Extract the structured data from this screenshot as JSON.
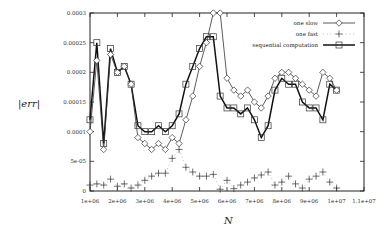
{
  "chart_data": {
    "type": "line",
    "title": "",
    "xlabel": "N",
    "ylabel": "|err|",
    "xlim": [
      1000000,
      11000000
    ],
    "ylim": [
      0,
      0.0003
    ],
    "grid": false,
    "legend_position": "top-right inside",
    "x_ticks": [
      "1e+06",
      "2e+06",
      "3e+06",
      "4e+06",
      "5e+06",
      "6e+06",
      "7e+06",
      "8e+06",
      "9e+06",
      "1e+07",
      "1.1e+07"
    ],
    "y_ticks": [
      "0",
      "5e-05",
      "0.0001",
      "0.00015",
      "0.0002",
      "0.00025",
      "0.0003"
    ],
    "x": [
      1000000,
      1250000,
      1500000,
      1750000,
      2000000,
      2250000,
      2500000,
      2750000,
      3000000,
      3250000,
      3500000,
      3750000,
      4000000,
      4250000,
      4500000,
      4750000,
      5000000,
      5250000,
      5500000,
      5750000,
      6000000,
      6250000,
      6500000,
      6750000,
      7000000,
      7250000,
      7500000,
      7750000,
      8000000,
      8250000,
      8500000,
      8750000,
      9000000,
      9250000,
      9500000,
      9750000,
      10000000
    ],
    "series": [
      {
        "name": "one slow",
        "marker": "diamond",
        "line": "solid",
        "values": [
          0.0001,
          0.00022,
          7e-05,
          0.00023,
          0.0002,
          0.00021,
          0.00018,
          9e-05,
          8e-05,
          7e-05,
          8e-05,
          7e-05,
          9e-05,
          8e-05,
          0.00012,
          0.00016,
          0.00021,
          0.00025,
          0.0003,
          0.0003,
          0.00019,
          0.00017,
          0.00016,
          0.00017,
          0.00015,
          0.00014,
          0.00016,
          0.00019,
          0.0002,
          0.0002,
          0.00019,
          0.00018,
          0.00017,
          0.00016,
          0.0002,
          0.00019,
          0.00017
        ]
      },
      {
        "name": "one fast",
        "marker": "plus",
        "line": "dotted",
        "values": [
          1e-05,
          1.2e-05,
          1e-05,
          2e-05,
          8e-06,
          1.2e-05,
          5e-06,
          1e-05,
          1.8e-05,
          2.5e-05,
          3e-05,
          3e-05,
          5.5e-05,
          7e-05,
          4e-05,
          3.2e-05,
          2.5e-05,
          2.5e-05,
          2.8e-05,
          3e-06,
          1.8e-05,
          4e-06,
          1e-05,
          1.5e-05,
          2.2e-05,
          2.7e-05,
          3.2e-05,
          1e-05,
          1.5e-05,
          2.5e-05,
          1.2e-05,
          5e-06,
          2e-05,
          2.5e-05,
          3.2e-05,
          1.5e-05,
          5e-06
        ]
      },
      {
        "name": "sequential computation",
        "marker": "square",
        "line": "solid",
        "values": [
          0.00012,
          0.00025,
          8e-05,
          0.00024,
          0.0002,
          0.00021,
          0.00018,
          0.00011,
          0.0001,
          0.0001,
          0.00011,
          0.0001,
          0.00011,
          0.00013,
          0.00018,
          0.00021,
          0.00024,
          0.00026,
          0.00026,
          0.00016,
          0.00014,
          0.00014,
          0.00013,
          0.00014,
          0.00012,
          9e-05,
          0.00011,
          0.00017,
          0.00019,
          0.00018,
          0.00018,
          0.00015,
          0.00014,
          0.00014,
          0.00012,
          0.00018,
          0.00017
        ]
      }
    ]
  },
  "legend": {
    "items": [
      {
        "label": "one slow"
      },
      {
        "label": "one fast"
      },
      {
        "label": "sequential computation"
      }
    ]
  },
  "axes": {
    "xlabel": "N",
    "ylabel": "|err|"
  }
}
